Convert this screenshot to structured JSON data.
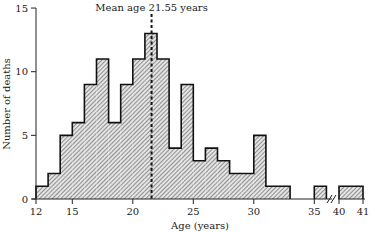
{
  "chart_data": {
    "type": "bar",
    "subtype": "histogram",
    "title": "",
    "xlabel": "Age (years)",
    "ylabel": "Number of deaths",
    "xlim": [
      12,
      41
    ],
    "ylim": [
      0,
      15
    ],
    "x_ticks": [
      12,
      15,
      20,
      25,
      30,
      35,
      40,
      41
    ],
    "y_ticks": [
      0,
      5,
      10,
      15
    ],
    "axis_break": {
      "between": [
        37,
        40
      ]
    },
    "grid": false,
    "legend": null,
    "annotations": [
      {
        "type": "vline",
        "x": 21.55,
        "style": "dashed",
        "label": "Mean age 21.55 years"
      }
    ],
    "bins": [
      {
        "from": 12,
        "to": 13,
        "value": 1
      },
      {
        "from": 13,
        "to": 14,
        "value": 2
      },
      {
        "from": 14,
        "to": 15,
        "value": 5
      },
      {
        "from": 15,
        "to": 16,
        "value": 6
      },
      {
        "from": 16,
        "to": 17,
        "value": 9
      },
      {
        "from": 17,
        "to": 18,
        "value": 11
      },
      {
        "from": 18,
        "to": 19,
        "value": 6
      },
      {
        "from": 19,
        "to": 20,
        "value": 9
      },
      {
        "from": 20,
        "to": 21,
        "value": 11
      },
      {
        "from": 21,
        "to": 22,
        "value": 13
      },
      {
        "from": 22,
        "to": 23,
        "value": 11
      },
      {
        "from": 23,
        "to": 24,
        "value": 4
      },
      {
        "from": 24,
        "to": 25,
        "value": 9
      },
      {
        "from": 25,
        "to": 26,
        "value": 3
      },
      {
        "from": 26,
        "to": 27,
        "value": 4
      },
      {
        "from": 27,
        "to": 28,
        "value": 3
      },
      {
        "from": 28,
        "to": 29,
        "value": 2
      },
      {
        "from": 29,
        "to": 30,
        "value": 2
      },
      {
        "from": 30,
        "to": 31,
        "value": 5
      },
      {
        "from": 31,
        "to": 32,
        "value": 1
      },
      {
        "from": 32,
        "to": 33,
        "value": 1
      },
      {
        "from": 35,
        "to": 36,
        "value": 1
      },
      {
        "from": 40,
        "to": 41,
        "value": 1
      }
    ],
    "categories": [
      "12",
      "13",
      "14",
      "15",
      "16",
      "17",
      "18",
      "19",
      "20",
      "21",
      "22",
      "23",
      "24",
      "25",
      "26",
      "27",
      "28",
      "29",
      "30",
      "31",
      "32",
      "35",
      "40"
    ],
    "values": [
      1,
      2,
      5,
      6,
      9,
      11,
      6,
      9,
      11,
      13,
      11,
      4,
      9,
      3,
      4,
      3,
      2,
      2,
      5,
      1,
      1,
      1,
      1
    ]
  },
  "labels": {
    "mean": "Mean age 21.55 years",
    "xlabel": "Age (years)",
    "ylabel": "Number of deaths"
  },
  "colors": {
    "fill": "#d0d0d0",
    "hatch": "#555555",
    "outline": "#111111"
  }
}
